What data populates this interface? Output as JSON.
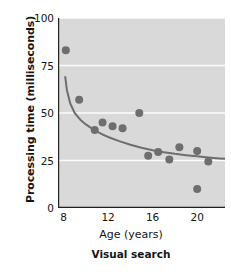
{
  "chart_data": {
    "type": "scatter",
    "title": "",
    "caption": "Visual search",
    "xlabel": "Age (years)",
    "ylabel": "Processing time (milliseconds)",
    "xlim": [
      7.5,
      22.5
    ],
    "ylim": [
      0,
      100
    ],
    "xticks": [
      8,
      12,
      16,
      20
    ],
    "yticks": [
      0,
      25,
      50,
      75,
      100
    ],
    "xtick_labels": [
      "8",
      "12",
      "16",
      "20"
    ],
    "ytick_labels": [
      "0",
      "25",
      "50",
      "75",
      "100"
    ],
    "grid": "horizontal-white-gridlines",
    "legend": "none",
    "plot_background": "#d9d9d9",
    "point_color": "#6e6e6e",
    "curve_color": "#6e6e6e",
    "axis_color": "#222222",
    "point_radius_px": 4,
    "series": [
      {
        "name": "Visual search",
        "x": [
          8.2,
          9.4,
          10.8,
          11.5,
          12.4,
          13.3,
          14.8,
          15.6,
          16.5,
          17.5,
          18.4,
          20.0,
          20.0,
          21.0
        ],
        "y": [
          83,
          57,
          41,
          45,
          43,
          42,
          50,
          27.5,
          29.5,
          25.5,
          32,
          30,
          10,
          24.5
        ]
      }
    ],
    "fit_curve": {
      "name": "decay-fit-line",
      "x": [
        8.15,
        8.3,
        8.6,
        9.0,
        9.5,
        10.0,
        10.5,
        11.0,
        11.5,
        12.0,
        13.0,
        14.0,
        15.0,
        16.0,
        17.0,
        18.0,
        19.0,
        20.0,
        21.0,
        22.0,
        22.5
      ],
      "y": [
        69,
        62,
        55,
        50,
        46.5,
        44,
        42,
        40.2,
        38.7,
        37.4,
        35.2,
        33.3,
        31.7,
        30.4,
        29.4,
        28.5,
        27.8,
        27.2,
        26.6,
        26.1,
        25.9
      ]
    }
  }
}
